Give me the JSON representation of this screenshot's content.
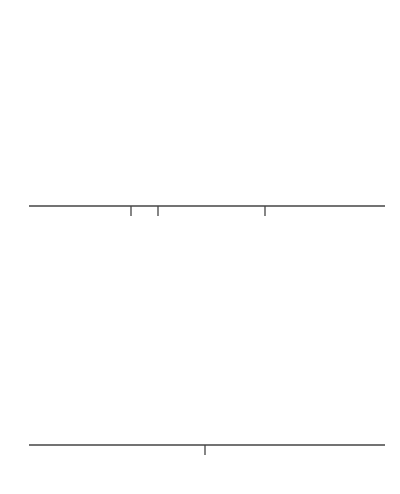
{
  "top_panel": {
    "title": "The populations under H",
    "title_subscript": "a",
    "axis_label": "x",
    "ticks": [
      {
        "symbol": "μ",
        "sub": "1"
      },
      {
        "symbol": "μ",
        "sub": "2"
      },
      {
        "symbol": "μ",
        "sub": "3"
      }
    ]
  },
  "bottom_panel": {
    "title": "The populations under H",
    "title_subscript": "0",
    "axis_label": "x",
    "label_parts": [
      "μ",
      "1",
      "= ",
      "μ",
      "2",
      "=",
      "μ",
      "3"
    ]
  },
  "colors": {
    "curve": "#808080",
    "axis": "#444444",
    "text": "#555555"
  },
  "chart_data": [
    {
      "type": "line",
      "title": "The populations under Ha",
      "xlabel": "x",
      "series": [
        {
          "name": "Population 1",
          "mean_label": "μ1",
          "center_px": 135
        },
        {
          "name": "Population 2",
          "mean_label": "μ2",
          "center_px": 164
        },
        {
          "name": "Population 3",
          "mean_label": "μ3",
          "center_px": 270
        }
      ],
      "tick_labels": [
        "μ1",
        "μ2",
        "μ3"
      ],
      "grid": false
    },
    {
      "type": "line",
      "title": "The populations under H0",
      "xlabel": "x",
      "series": [
        {
          "name": "All populations",
          "mean_label": "μ1 = μ2 = μ3",
          "center_px": 207
        }
      ],
      "tick_labels": [
        "μ1 = μ2 = μ3"
      ],
      "grid": false
    }
  ]
}
